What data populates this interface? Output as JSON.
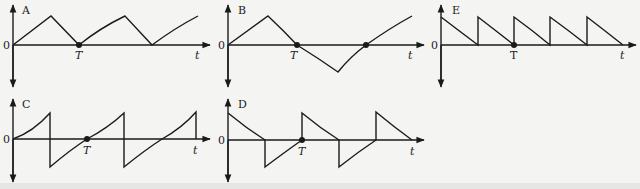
{
  "figure": {
    "background": "#f4f4f2",
    "ink_color": "#1a1a1a",
    "zero_label": "0",
    "time_label": "t",
    "period_label": "T",
    "panels": [
      {
        "id": "A",
        "label": "A",
        "description": "Triangular wave, positive only, returns to zero at T"
      },
      {
        "id": "B",
        "label": "B",
        "description": "Triangular wave alternating positive then negative, crosses zero at T"
      },
      {
        "id": "E",
        "label": "E",
        "description": "Decaying sawtooth pulses, positive only, multiple per T"
      },
      {
        "id": "C",
        "label": "C",
        "description": "Sawtooth rising curve with sharp drops, alternating sign"
      },
      {
        "id": "D",
        "label": "D",
        "description": "Decaying pulses alternating positive and negative"
      }
    ]
  }
}
